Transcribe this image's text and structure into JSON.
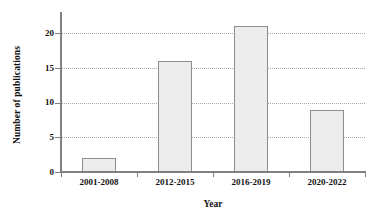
{
  "chart_data": {
    "type": "bar",
    "title": "",
    "xlabel": "Year",
    "ylabel": "Number of publications",
    "categories": [
      "2001-2008",
      "2012-2015",
      "2016-2019",
      "2020-2022"
    ],
    "values": [
      2,
      16,
      21,
      9
    ],
    "ylim": [
      0,
      22.5
    ],
    "yticks": [
      0,
      5,
      10,
      15,
      20
    ],
    "ytick_labels": [
      "0",
      "5",
      "10",
      "15",
      "20"
    ],
    "grid": "horizontal-dotted",
    "legend": "none",
    "bar_fill_color": "#ececec",
    "bar_edge_color": "#8e8e8e",
    "gridline_color": "#9a9a9a",
    "axis_color": "#808080",
    "background_color": "#ffffff"
  }
}
